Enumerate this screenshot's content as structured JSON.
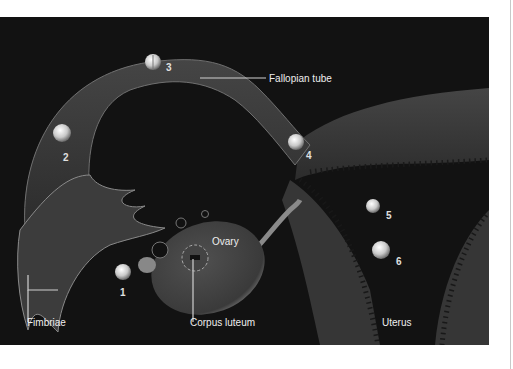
{
  "figure": {
    "background_color": "#121212",
    "tissue_color": "#3a3a3a",
    "highlight_color": "#bdbdbd",
    "labels": {
      "fallopian_tube": "Fallopian tube",
      "ovary": "Ovary",
      "fimbriae": "Fimbriae",
      "corpus_luteum": "Corpus luteum",
      "uterus": "Uterus"
    },
    "stages": [
      {
        "number": "1",
        "depicts": "ovulated-oocyte"
      },
      {
        "number": "2",
        "depicts": "fertilization"
      },
      {
        "number": "3",
        "depicts": "two-cell-stage"
      },
      {
        "number": "4",
        "depicts": "morula"
      },
      {
        "number": "5",
        "depicts": "blastocyst"
      },
      {
        "number": "6",
        "depicts": "implantation"
      }
    ]
  }
}
